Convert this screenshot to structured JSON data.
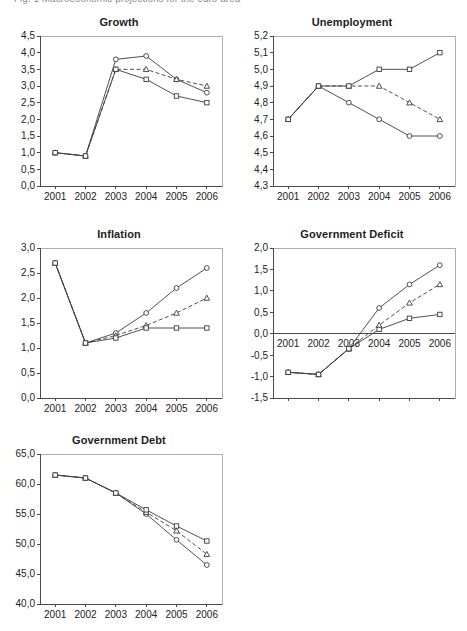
{
  "figure": {
    "cropped_header_text": "Fig. 1  Macroeconomic projections for the euro area",
    "categories": [
      "2001",
      "2002",
      "2003",
      "2004",
      "2005",
      "2006"
    ],
    "series_names": [
      "scenario-circle",
      "scenario-triangle",
      "scenario-square"
    ],
    "line_color": "#3c3c3c",
    "marker_fill": "#ffffff",
    "axis_color": "#4a4a4a"
  },
  "chart_data": [
    {
      "type": "line",
      "title": "Growth",
      "xlabel": "",
      "ylabel": "",
      "x": [
        "2001",
        "2002",
        "2003",
        "2004",
        "2005",
        "2006"
      ],
      "ylim": [
        0.0,
        4.5
      ],
      "yticks": [
        "0,0",
        "0,5",
        "1,0",
        "1,5",
        "2,0",
        "2,5",
        "3,0",
        "3,5",
        "4,0",
        "4,5"
      ],
      "ytick_values": [
        0.0,
        0.5,
        1.0,
        1.5,
        2.0,
        2.5,
        3.0,
        3.5,
        4.0,
        4.5
      ],
      "grid": false,
      "legend": "none",
      "series": [
        {
          "name": "scenario-circle",
          "marker": "circle",
          "dash": false,
          "values": [
            1.0,
            0.9,
            3.8,
            3.9,
            3.2,
            2.8
          ]
        },
        {
          "name": "scenario-triangle",
          "marker": "triangle",
          "dash": true,
          "values": [
            1.0,
            0.9,
            3.5,
            3.5,
            3.2,
            3.0
          ]
        },
        {
          "name": "scenario-square",
          "marker": "square",
          "dash": false,
          "values": [
            1.0,
            0.9,
            3.5,
            3.2,
            2.7,
            2.5
          ]
        }
      ]
    },
    {
      "type": "line",
      "title": "Unemployment",
      "xlabel": "",
      "ylabel": "",
      "x": [
        "2001",
        "2002",
        "2003",
        "2004",
        "2005",
        "2006"
      ],
      "ylim": [
        4.3,
        5.2
      ],
      "yticks": [
        "4,3",
        "4,4",
        "4,5",
        "4,6",
        "4,7",
        "4,8",
        "4,9",
        "5,0",
        "5,1",
        "5,2"
      ],
      "ytick_values": [
        4.3,
        4.4,
        4.5,
        4.6,
        4.7,
        4.8,
        4.9,
        5.0,
        5.1,
        5.2
      ],
      "grid": false,
      "legend": "none",
      "series": [
        {
          "name": "scenario-circle",
          "marker": "circle",
          "dash": false,
          "values": [
            4.7,
            4.9,
            4.8,
            4.7,
            4.6,
            4.6
          ]
        },
        {
          "name": "scenario-triangle",
          "marker": "triangle",
          "dash": true,
          "values": [
            4.7,
            4.9,
            4.9,
            4.9,
            4.8,
            4.7
          ]
        },
        {
          "name": "scenario-square",
          "marker": "square",
          "dash": false,
          "values": [
            4.7,
            4.9,
            4.9,
            5.0,
            5.0,
            5.1
          ]
        }
      ]
    },
    {
      "type": "line",
      "title": "Inflation",
      "xlabel": "",
      "ylabel": "",
      "x": [
        "2001",
        "2002",
        "2003",
        "2004",
        "2005",
        "2006"
      ],
      "ylim": [
        0.0,
        3.0
      ],
      "yticks": [
        "0,0",
        "0,5",
        "1,0",
        "1,5",
        "2,0",
        "2,5",
        "3,0"
      ],
      "ytick_values": [
        0.0,
        0.5,
        1.0,
        1.5,
        2.0,
        2.5,
        3.0
      ],
      "grid": false,
      "legend": "none",
      "series": [
        {
          "name": "scenario-circle",
          "marker": "circle",
          "dash": false,
          "values": [
            2.7,
            1.1,
            1.3,
            1.7,
            2.2,
            2.6
          ]
        },
        {
          "name": "scenario-triangle",
          "marker": "triangle",
          "dash": true,
          "values": [
            2.7,
            1.1,
            1.25,
            1.45,
            1.7,
            2.0
          ]
        },
        {
          "name": "scenario-square",
          "marker": "square",
          "dash": false,
          "values": [
            2.7,
            1.1,
            1.2,
            1.4,
            1.4,
            1.4
          ]
        }
      ]
    },
    {
      "type": "line",
      "title": "Government Deficit",
      "xlabel": "",
      "ylabel": "",
      "x": [
        "2001",
        "2002",
        "2003",
        "2004",
        "2005",
        "2006"
      ],
      "ylim": [
        -1.5,
        2.0
      ],
      "yticks": [
        "-1,5",
        "-1,0",
        "-0,5",
        "0,0",
        "0,5",
        "1,0",
        "1,5",
        "2,0"
      ],
      "ytick_values": [
        -1.5,
        -1.0,
        -0.5,
        0.0,
        0.5,
        1.0,
        1.5,
        2.0
      ],
      "grid": false,
      "legend": "none",
      "zero_axis": true,
      "series": [
        {
          "name": "scenario-circle",
          "marker": "circle",
          "dash": false,
          "values": [
            -0.9,
            -0.95,
            -0.35,
            0.6,
            1.15,
            1.6
          ]
        },
        {
          "name": "scenario-triangle",
          "marker": "triangle",
          "dash": true,
          "values": [
            -0.9,
            -0.95,
            -0.35,
            0.2,
            0.72,
            1.15
          ]
        },
        {
          "name": "scenario-square",
          "marker": "square",
          "dash": false,
          "values": [
            -0.9,
            -0.95,
            -0.35,
            0.1,
            0.36,
            0.45
          ]
        }
      ]
    },
    {
      "type": "line",
      "title": "Government Debt",
      "xlabel": "",
      "ylabel": "",
      "x": [
        "2001",
        "2002",
        "2003",
        "2004",
        "2005",
        "2006"
      ],
      "ylim": [
        40.0,
        65.0
      ],
      "yticks": [
        "40,0",
        "45,0",
        "50,0",
        "55,0",
        "60,0",
        "65,0"
      ],
      "ytick_values": [
        40.0,
        45.0,
        50.0,
        55.0,
        60.0,
        65.0
      ],
      "grid": false,
      "legend": "none",
      "series": [
        {
          "name": "scenario-circle",
          "marker": "circle",
          "dash": false,
          "values": [
            61.5,
            61.0,
            58.5,
            55.0,
            50.7,
            46.5
          ]
        },
        {
          "name": "scenario-triangle",
          "marker": "triangle",
          "dash": true,
          "values": [
            61.5,
            61.0,
            58.5,
            55.3,
            52.2,
            48.3
          ]
        },
        {
          "name": "scenario-square",
          "marker": "square",
          "dash": false,
          "values": [
            61.5,
            61.0,
            58.5,
            55.7,
            53.0,
            50.5
          ]
        }
      ]
    }
  ]
}
